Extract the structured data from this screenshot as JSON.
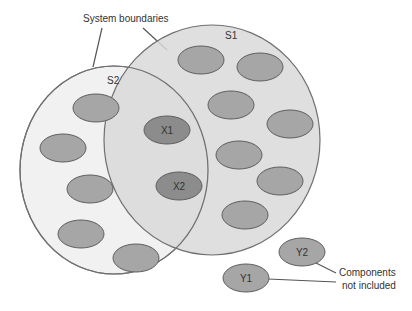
{
  "diagram": {
    "annotations": {
      "system_boundaries": "System boundaries",
      "components_not_included_line1": "Components",
      "components_not_included_line2": "not included"
    },
    "systems": [
      {
        "id": "S1",
        "label": "S1",
        "fill": "#d9d9d9",
        "stroke": "#707070"
      },
      {
        "id": "S2",
        "label": "S2",
        "fill": "#f1f1f1",
        "stroke": "#707070"
      }
    ],
    "components": {
      "shared": [
        {
          "id": "X1",
          "label": "X1"
        },
        {
          "id": "X2",
          "label": "X2"
        }
      ],
      "excluded": [
        {
          "id": "Y1",
          "label": "Y1"
        },
        {
          "id": "Y2",
          "label": "Y2"
        }
      ]
    },
    "colors": {
      "component_fill": "#a6a6a6",
      "shared_fill": "#8c8c8c",
      "component_stroke": "#5e5e5e",
      "line": "#555555"
    }
  }
}
